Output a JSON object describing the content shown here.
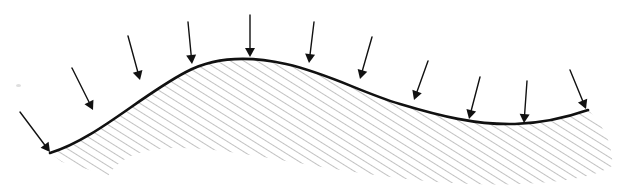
{
  "figure": {
    "kind": "engineering-mechanics-diagram",
    "canvas": {
      "width": 631,
      "height": 193,
      "background": "#ffffff"
    },
    "labels": [],
    "colors": {
      "surface_line": "#111111",
      "hatch_line": "#8f8f8f",
      "arrow": "#111111",
      "background": "#ffffff"
    },
    "surface": {
      "name": "curved-surface-boundary",
      "stroke_width": 2.6,
      "description": "Single smooth wave: rises from lower-left to a crest, falls through an inflection to a trough, then rises slightly to the right end.",
      "path": "M 50 153 C 96 139, 140 96, 186 72 C 216 56, 250 56, 286 64 C 330 74, 360 92, 400 104 C 440 116, 476 125, 515 124 C 545 123, 568 117, 588 110",
      "key_points": [
        {
          "name": "left-end",
          "x": 50,
          "y": 153
        },
        {
          "name": "crest",
          "x": 252,
          "y": 58
        },
        {
          "name": "inflection",
          "x": 400,
          "y": 92
        },
        {
          "name": "trough",
          "x": 516,
          "y": 124
        },
        {
          "name": "right-end",
          "x": 588,
          "y": 110
        }
      ]
    },
    "hatched_body": {
      "name": "hatched-material-region",
      "hatch_angle_deg": 58,
      "hatch_spacing_px": 7,
      "hatch_stroke_width": 1.1,
      "region_path": "M 50 153 C 96 139, 140 96, 186 72 C 216 56, 250 56, 286 64 C 330 74, 360 92, 400 104 C 440 116, 476 125, 515 124 C 545 123, 568 117, 588 110 C 603 124, 614 146, 612 166 C 590 180, 540 186, 470 184 C 380 180, 300 162, 230 152 C 170 144, 126 146, 108 176 C 96 172, 78 166, 62 162 Z",
      "bottom_boundary_note": "Lower edge has no drawn outline; the hatching simply terminates along a wavy curve offset below the top surface."
    },
    "arrows": {
      "name": "distributed-load-arrows",
      "count": 11,
      "head_length": 9,
      "head_half_width": 5,
      "shaft_width": 1.4,
      "description": "Each arrow is normal to the surface and points inward (into the body), representing a distributed pressure load.",
      "items": [
        {
          "index": 1,
          "tail_x": 20,
          "tail_y": 112,
          "tip_x": 50,
          "tip_y": 152,
          "length": 50,
          "angle_deg": 53
        },
        {
          "index": 2,
          "tail_x": 72,
          "tail_y": 68,
          "tip_x": 93,
          "tip_y": 110,
          "length": 47,
          "angle_deg": 63
        },
        {
          "index": 3,
          "tail_x": 128,
          "tail_y": 36,
          "tip_x": 140,
          "tip_y": 80,
          "length": 46,
          "angle_deg": 75
        },
        {
          "index": 4,
          "tail_x": 188,
          "tail_y": 22,
          "tip_x": 192,
          "tip_y": 64,
          "length": 42,
          "angle_deg": 84
        },
        {
          "index": 5,
          "tail_x": 250,
          "tail_y": 15,
          "tip_x": 250,
          "tip_y": 57,
          "length": 42,
          "angle_deg": 90
        },
        {
          "index": 6,
          "tail_x": 314,
          "tail_y": 22,
          "tip_x": 309,
          "tip_y": 63,
          "length": 41,
          "angle_deg": 97
        },
        {
          "index": 7,
          "tail_x": 372,
          "tail_y": 37,
          "tip_x": 360,
          "tip_y": 79,
          "length": 44,
          "angle_deg": 106
        },
        {
          "index": 8,
          "tail_x": 428,
          "tail_y": 61,
          "tip_x": 414,
          "tip_y": 100,
          "length": 41,
          "angle_deg": 110
        },
        {
          "index": 9,
          "tail_x": 480,
          "tail_y": 77,
          "tip_x": 469,
          "tip_y": 119,
          "length": 43,
          "angle_deg": 104
        },
        {
          "index": 10,
          "tail_x": 527,
          "tail_y": 81,
          "tip_x": 524,
          "tip_y": 123,
          "length": 42,
          "angle_deg": 94
        },
        {
          "index": 11,
          "tail_x": 570,
          "tail_y": 70,
          "tip_x": 586,
          "tip_y": 109,
          "length": 42,
          "angle_deg": 68
        }
      ]
    },
    "artifacts": [
      {
        "name": "scan-speck",
        "x": 16,
        "y": 84,
        "width": 5,
        "height": 3
      }
    ]
  }
}
